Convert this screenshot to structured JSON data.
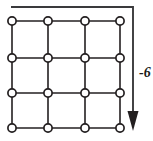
{
  "figure": {
    "background_color": "#ffffff",
    "line_color": "#231f20",
    "node_fill_color": "#ffffff",
    "arrow_color": "#231f20",
    "label_color": "#1a1a1a"
  },
  "lattice": {
    "rows": 4,
    "cols": 4,
    "node_radius": 4.1,
    "column_x": [
      12,
      48,
      85,
      120
    ],
    "row_y": [
      21,
      58,
      93,
      128
    ],
    "node_count": 16,
    "nodes": [
      {
        "row": 0,
        "col": 0,
        "cx": 12,
        "cy": 21
      },
      {
        "row": 0,
        "col": 1,
        "cx": 48,
        "cy": 21
      },
      {
        "row": 0,
        "col": 2,
        "cx": 85,
        "cy": 21
      },
      {
        "row": 0,
        "col": 3,
        "cx": 120,
        "cy": 21
      },
      {
        "row": 1,
        "col": 0,
        "cx": 12,
        "cy": 58
      },
      {
        "row": 1,
        "col": 1,
        "cx": 48,
        "cy": 58
      },
      {
        "row": 1,
        "col": 2,
        "cx": 85,
        "cy": 58
      },
      {
        "row": 1,
        "col": 3,
        "cx": 120,
        "cy": 58
      },
      {
        "row": 2,
        "col": 0,
        "cx": 12,
        "cy": 93
      },
      {
        "row": 2,
        "col": 1,
        "cx": 48,
        "cy": 93
      },
      {
        "row": 2,
        "col": 2,
        "cx": 85,
        "cy": 93
      },
      {
        "row": 2,
        "col": 3,
        "cx": 120,
        "cy": 93
      },
      {
        "row": 3,
        "col": 0,
        "cx": 12,
        "cy": 128
      },
      {
        "row": 3,
        "col": 1,
        "cx": 48,
        "cy": 128
      },
      {
        "row": 3,
        "col": 2,
        "cx": 85,
        "cy": 128
      },
      {
        "row": 3,
        "col": 3,
        "cx": 120,
        "cy": 128
      }
    ],
    "horizontal_edges": [
      {
        "x1": 12,
        "y1": 21,
        "x2": 120,
        "y2": 21
      },
      {
        "x1": 12,
        "y1": 58,
        "x2": 120,
        "y2": 58
      },
      {
        "x1": 12,
        "y1": 93,
        "x2": 120,
        "y2": 93
      },
      {
        "x1": 12,
        "y1": 128,
        "x2": 120,
        "y2": 128
      }
    ],
    "vertical_edges": [
      {
        "x1": 12,
        "y1": 21,
        "x2": 12,
        "y2": 128
      },
      {
        "x1": 48,
        "y1": 21,
        "x2": 48,
        "y2": 128
      },
      {
        "x1": 85,
        "y1": 21,
        "x2": 85,
        "y2": 128
      },
      {
        "x1": 120,
        "y1": 21,
        "x2": 120,
        "y2": 128
      }
    ]
  },
  "flow_arrow": {
    "label": "-6",
    "direction": "down",
    "path_points": "11,7 133,7 133,112",
    "head_points": "133,131 127.5,111 138.5,111",
    "label_x": 139,
    "label_y": 77
  }
}
